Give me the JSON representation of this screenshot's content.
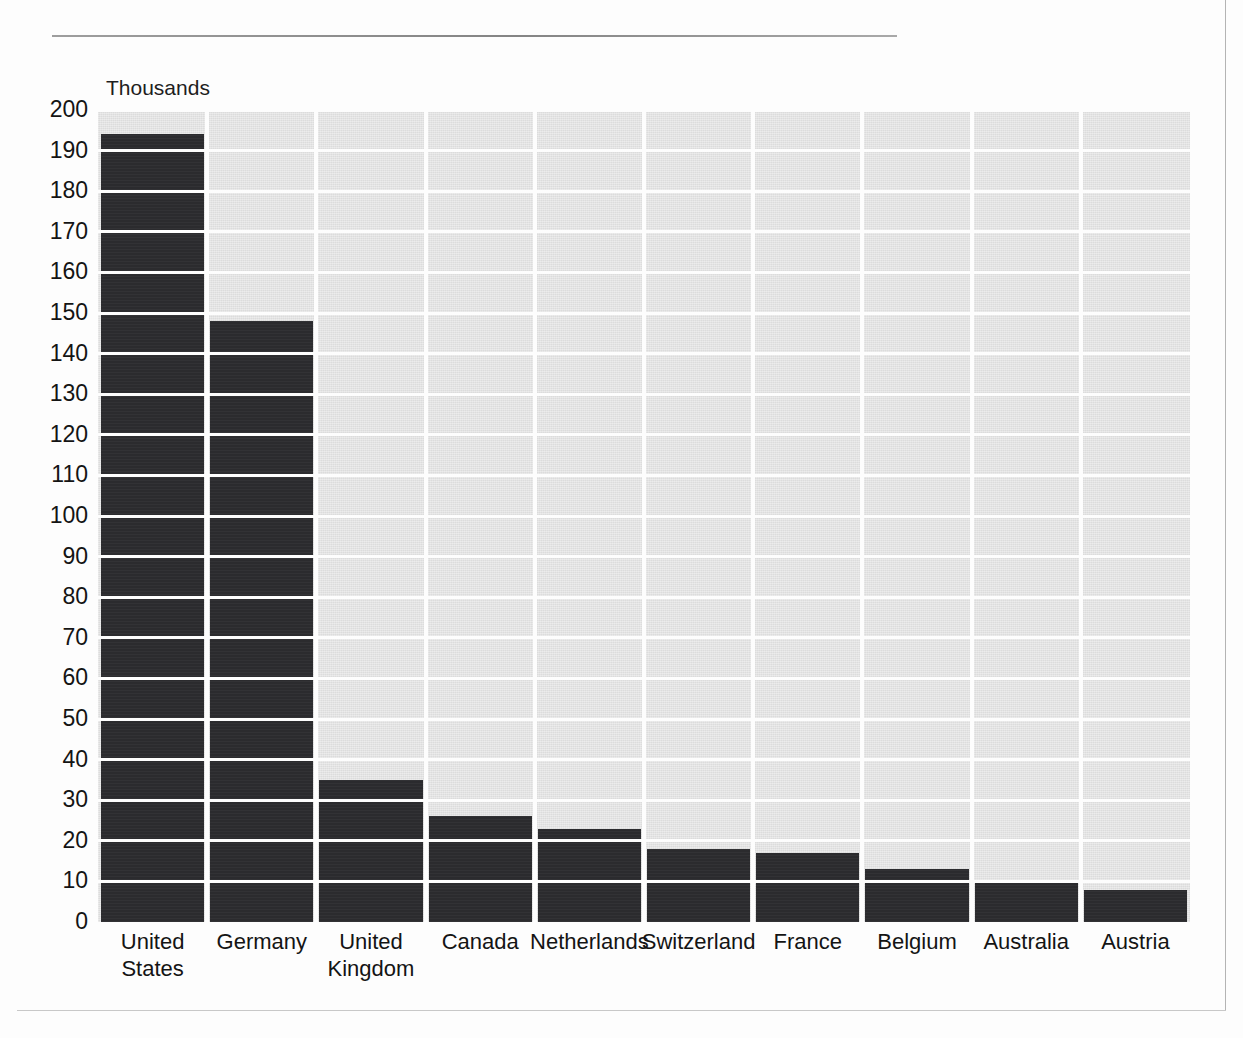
{
  "page": {
    "running_head": "",
    "background_color": "#fdfdfd"
  },
  "chart_data": {
    "type": "bar",
    "title": "",
    "subtitle": "",
    "xlabel": "",
    "ylabel": "Thousands",
    "unit_label": "Thousands",
    "categories": [
      "United States",
      "Germany",
      "United Kingdom",
      "Canada",
      "Netherlands",
      "Switzerland",
      "France",
      "Belgium",
      "Australia",
      "Austria"
    ],
    "category_lines": [
      [
        "United",
        "States"
      ],
      [
        "Germany"
      ],
      [
        "United",
        "Kingdom"
      ],
      [
        "Canada"
      ],
      [
        "Netherlands"
      ],
      [
        "Switzerland"
      ],
      [
        "France"
      ],
      [
        "Belgium"
      ],
      [
        "Australia"
      ],
      [
        "Austria"
      ]
    ],
    "values": [
      194,
      148,
      35,
      26,
      23,
      18,
      17,
      13,
      10,
      8
    ],
    "ylim": [
      0,
      200
    ],
    "ytick_step": 10,
    "yticks": [
      200,
      190,
      180,
      170,
      160,
      150,
      140,
      130,
      120,
      110,
      100,
      90,
      80,
      70,
      60,
      50,
      40,
      30,
      20,
      10,
      0
    ],
    "ytick_labels": [
      "200",
      "190",
      "180",
      "170",
      "160",
      "150",
      "140",
      "130",
      "120",
      "110",
      "100",
      "90",
      "80",
      "70",
      "60",
      "50",
      "40",
      "30",
      "20",
      "10",
      "0"
    ],
    "grid": true,
    "grid_color": "#fdfdfd",
    "legend": null,
    "legend_position": "none",
    "bar_color": "#2b2b2e",
    "plot_background_color": "#dcdcdc",
    "annotations": []
  }
}
